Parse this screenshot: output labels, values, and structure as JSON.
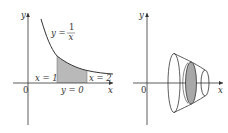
{
  "figures": [
    {
      "id": "region",
      "axes": {
        "x_label": "x",
        "y_label": "y",
        "origin_label": "0"
      },
      "curve_label": {
        "lhs": "y =",
        "numerator": "1",
        "denominator": "x"
      },
      "bound_labels": {
        "left": "x = 1",
        "right": "x = 2",
        "bottom": "y = 0"
      },
      "shade_color": "#b9b9b9"
    },
    {
      "id": "solid-of-revolution",
      "axes": {
        "x_label": "x",
        "y_label": "y",
        "origin_label": "0"
      },
      "shade_color": "#a8a8a8"
    }
  ],
  "colors": {
    "line": "#333333",
    "background": "#ffffff"
  }
}
